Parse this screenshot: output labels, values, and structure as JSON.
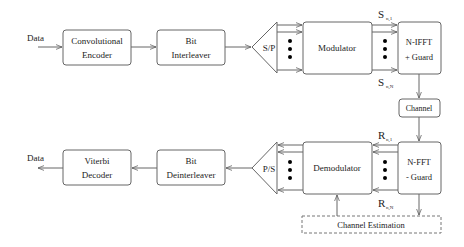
{
  "diagram": {
    "transmitter": {
      "input_label": "Data",
      "blocks": {
        "conv_encoder": [
          "Convolutional",
          "Encoder"
        ],
        "interleaver": [
          "Bit",
          "Interleaver"
        ],
        "sp": "S/P",
        "modulator": "Modulator",
        "ifft": [
          "N-IFFT",
          "+ Guard"
        ]
      },
      "signal_top": {
        "main": "S",
        "sub": "n,1"
      },
      "signal_bottom": {
        "main": "S",
        "sub": "n,N"
      }
    },
    "channel": "Channel",
    "receiver": {
      "output_label": "Data",
      "blocks": {
        "fft": [
          "N-FFT",
          "- Guard"
        ],
        "demodulator": "Demodulator",
        "ps": "P/S",
        "deinterleaver": [
          "Bit",
          "Deinterleaver"
        ],
        "decoder": [
          "Viterbi",
          "Decoder"
        ]
      },
      "signal_top": {
        "main": "R",
        "sub": "n,1"
      },
      "signal_bottom": {
        "main": "R",
        "sub": "n,N"
      },
      "channel_estimation": "Channel Estimation"
    }
  }
}
